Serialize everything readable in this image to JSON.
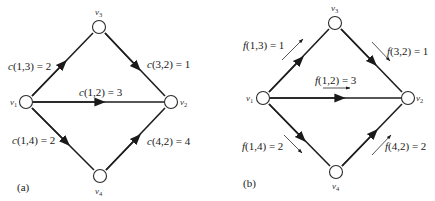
{
  "figure": {
    "panels": [
      {
        "id": "a",
        "caption": "(a)",
        "nodes": [
          {
            "id": "v1",
            "name": "v",
            "sub": "1",
            "x": 26,
            "y": 102
          },
          {
            "id": "v2",
            "name": "v",
            "sub": "2",
            "x": 171,
            "y": 102
          },
          {
            "id": "v3",
            "name": "v",
            "sub": "3",
            "x": 99,
            "y": 27
          },
          {
            "id": "v4",
            "name": "v",
            "sub": "4",
            "x": 100,
            "y": 176
          }
        ],
        "edges": [
          {
            "from": "v1",
            "to": "v3",
            "fn": "c",
            "args": "(1,3)",
            "eq": " = 2",
            "value": 2
          },
          {
            "from": "v3",
            "to": "v2",
            "fn": "c",
            "args": "(3,2)",
            "eq": " = 1",
            "value": 1
          },
          {
            "from": "v1",
            "to": "v2",
            "fn": "c",
            "args": "(1,2)",
            "eq": " = 3",
            "value": 3
          },
          {
            "from": "v1",
            "to": "v4",
            "fn": "c",
            "args": "(1,4)",
            "eq": " = 2",
            "value": 2
          },
          {
            "from": "v4",
            "to": "v2",
            "fn": "c",
            "args": "(4,2)",
            "eq": " = 4",
            "value": 4
          }
        ]
      },
      {
        "id": "b",
        "caption": "(b)",
        "nodes": [
          {
            "id": "v1",
            "name": "v",
            "sub": "1",
            "x": 263,
            "y": 98
          },
          {
            "id": "v2",
            "name": "v",
            "sub": "2",
            "x": 408,
            "y": 98
          },
          {
            "id": "v3",
            "name": "v",
            "sub": "3",
            "x": 335,
            "y": 23
          },
          {
            "id": "v4",
            "name": "v",
            "sub": "4",
            "x": 336,
            "y": 172
          }
        ],
        "edges": [
          {
            "from": "v1",
            "to": "v3",
            "fn": "f",
            "args": "(1,3)",
            "eq": " = 1",
            "value": 1
          },
          {
            "from": "v3",
            "to": "v2",
            "fn": "f",
            "args": "(3,2)",
            "eq": " = 1",
            "value": 1
          },
          {
            "from": "v1",
            "to": "v2",
            "fn": "f",
            "args": "(1,2)",
            "eq": " = 3",
            "value": 3
          },
          {
            "from": "v1",
            "to": "v4",
            "fn": "f",
            "args": "(1,4)",
            "eq": " = 2",
            "value": 2
          },
          {
            "from": "v4",
            "to": "v2",
            "fn": "f",
            "args": "(4,2)",
            "eq": " = 2",
            "value": 2
          }
        ]
      }
    ]
  }
}
